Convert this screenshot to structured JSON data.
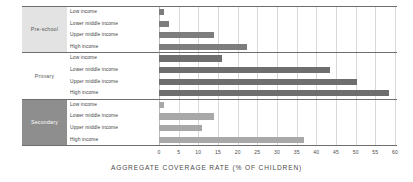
{
  "chart_data": {
    "type": "bar",
    "orientation": "horizontal",
    "title": "",
    "xlabel": "AGGREGATE COVERAGE RATE (% OF CHILDREN)",
    "ylabel": "",
    "xlim": [
      0,
      60
    ],
    "xticks": [
      0,
      5,
      10,
      15,
      20,
      25,
      30,
      35,
      40,
      45,
      50,
      55,
      60
    ],
    "grid": true,
    "legend": "none",
    "categories": [
      "Low income",
      "Lower middle income",
      "Upper middle income",
      "High income"
    ],
    "groups": [
      {
        "name": "Pre-school",
        "band_style": "shade-light",
        "bar_color": "#7d7d7d",
        "rows": [
          {
            "label": "Low income",
            "value": 1.2
          },
          {
            "label": "Lower middle income",
            "value": 2.5
          },
          {
            "label": "Upper middle income",
            "value": 14.0
          },
          {
            "label": "High income",
            "value": 22.3
          }
        ]
      },
      {
        "name": "Primary",
        "band_style": "shade-none",
        "bar_color": "#6e6e6e",
        "rows": [
          {
            "label": "Low income",
            "value": 16.0
          },
          {
            "label": "Lower middle income",
            "value": 43.5
          },
          {
            "label": "Upper middle income",
            "value": 50.3
          },
          {
            "label": "High income",
            "value": 58.5
          }
        ]
      },
      {
        "name": "Secondary",
        "band_style": "shade-dark",
        "bar_color": "#a8a8a8",
        "rows": [
          {
            "label": "Low income",
            "value": 1.3
          },
          {
            "label": "Lower middle income",
            "value": 14.0
          },
          {
            "label": "Upper middle income",
            "value": 11.0
          },
          {
            "label": "High income",
            "value": 36.8
          }
        ]
      }
    ],
    "colors": {
      "pre_school_bar": "#7d7d7d",
      "primary_bar": "#6e6e6e",
      "secondary_bar": "#a8a8a8",
      "band_light": "#e3e3e3",
      "band_dark": "#8e8e8e",
      "gridline": "#d8d8d8",
      "separator": "#6e6e6e",
      "text": "#4a4a4a",
      "background": "#ffffff"
    }
  }
}
